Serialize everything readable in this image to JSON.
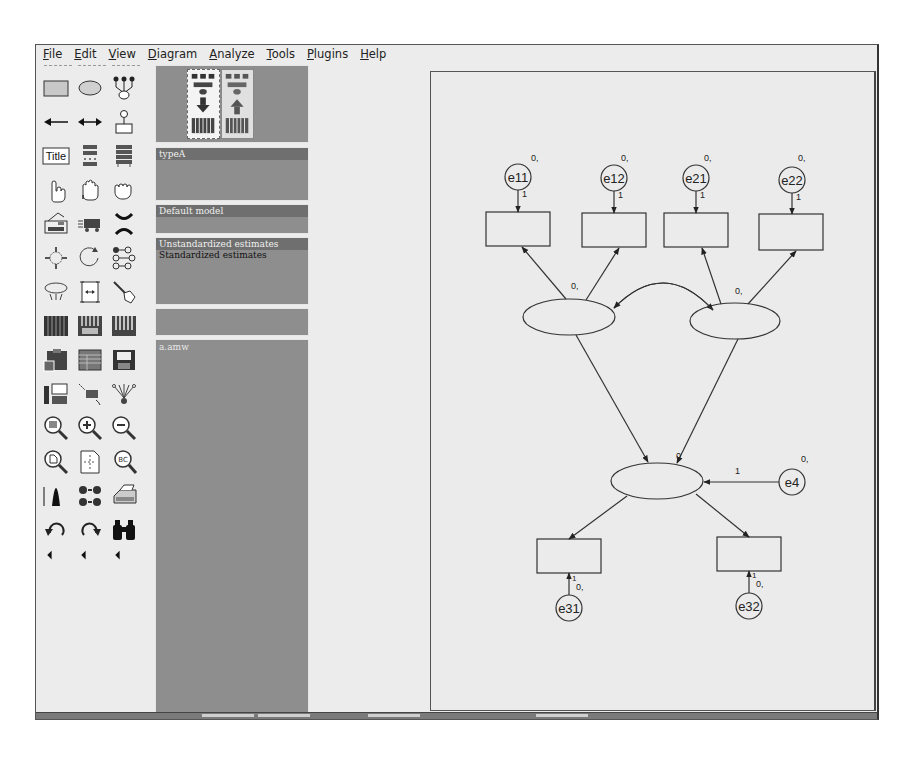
{
  "menu": {
    "items": [
      {
        "key": "file",
        "accel": "F",
        "rest": "ile"
      },
      {
        "key": "edit",
        "accel": "E",
        "rest": "dit"
      },
      {
        "key": "view",
        "accel": "V",
        "rest": "iew"
      },
      {
        "key": "diagram",
        "accel": "D",
        "rest": "iagram"
      },
      {
        "key": "analyze",
        "accel": "A",
        "rest": "nalyze"
      },
      {
        "key": "tools",
        "accel": "T",
        "rest": "ools"
      },
      {
        "key": "plugins",
        "accel": "P",
        "rest": "lugins"
      },
      {
        "key": "help",
        "accel": "H",
        "rest": "elp"
      }
    ]
  },
  "toolbox": {
    "title_button_label": "Title",
    "tools": [
      "rectangle-observed-variable-icon",
      "ellipse-unobserved-variable-icon",
      "latent-indicator-icon",
      "single-arrow-path-icon",
      "double-arrow-covariance-icon",
      "unique-variable-icon",
      "title-icon",
      "list-variables-in-model-icon",
      "list-variables-in-dataset-icon",
      "select-one-object-icon",
      "select-all-objects-icon",
      "deselect-all-icon",
      "duplicate-objects-icon",
      "move-objects-icon",
      "erase-objects-icon",
      "change-shape-icon",
      "rotate-indicators-icon",
      "reflect-indicators-icon",
      "move-parameter-icon",
      "scroll-diagram-icon",
      "touch-up-variable-icon",
      "select-data-files-icon",
      "analysis-properties-icon",
      "calculate-estimates-icon",
      "copy-to-clipboard-icon",
      "view-text-output-icon",
      "save-diagram-icon",
      "object-properties-icon",
      "drag-properties-icon",
      "preserve-symmetries-icon",
      "zoom-in-area-icon",
      "zoom-in-icon",
      "zoom-out-icon",
      "zoom-page-icon",
      "fit-to-page-icon",
      "magnify-glass-icon",
      "degrees-of-freedom-icon",
      "multiple-group-icon",
      "print-icon",
      "undo-icon",
      "redo-icon",
      "specification-search-icon",
      "scroll-left-icon",
      "scroll-left-icon",
      "scroll-left-icon"
    ]
  },
  "panels": {
    "view_toggle": {
      "input_label": "View input path diagram",
      "output_label": "View output path diagram"
    },
    "groups": {
      "header": "typeA"
    },
    "models": {
      "header": "Default model"
    },
    "estimates": {
      "selected": "Unstandardized estimates",
      "other": "Standardized estimates"
    },
    "computation": {
      "header": ""
    },
    "files": {
      "header": "a.amw"
    }
  },
  "diagram": {
    "errors_top": [
      {
        "name": "e11",
        "mean": "0,",
        "weight": "1"
      },
      {
        "name": "e12",
        "mean": "0,",
        "weight": "1"
      },
      {
        "name": "e21",
        "mean": "0,",
        "weight": "1"
      },
      {
        "name": "e22",
        "mean": "0,",
        "weight": "1"
      }
    ],
    "latent_left": {
      "label": "0,"
    },
    "latent_right": {
      "label": "0,"
    },
    "latent_bottom": {
      "label": "0"
    },
    "disturbance": {
      "name": "e4",
      "mean": "0,",
      "weight": "1"
    },
    "errors_bottom": [
      {
        "name": "e31",
        "mean": "0,",
        "weight": "1"
      },
      {
        "name": "e32",
        "mean": "0,",
        "weight": "1"
      }
    ]
  },
  "colors": {
    "panel_bg": "#8e8e8e",
    "panel_header": "#6f6f6f",
    "window_bg": "#ececec",
    "canvas_bg": "#ebebeb"
  }
}
